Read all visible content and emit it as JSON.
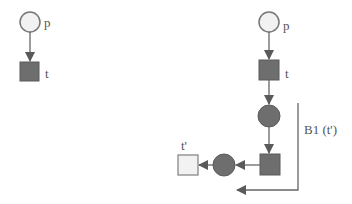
{
  "diagram": {
    "type": "petri-net",
    "colors": {
      "line": "#666666",
      "place_empty_fill": "#f2f2f2",
      "place_filled": "#6e6e6e",
      "transition_filled": "#6e6e6e",
      "transition_empty_fill": "#f2f2f2",
      "label": "#555555"
    },
    "left_net": {
      "place": {
        "label": "p"
      },
      "transition": {
        "label": "t"
      }
    },
    "right_net": {
      "place": {
        "label": "p"
      },
      "transition": {
        "label": "t"
      },
      "new_transition": {
        "label": "t'"
      },
      "block_label": "B1 (t')"
    }
  }
}
